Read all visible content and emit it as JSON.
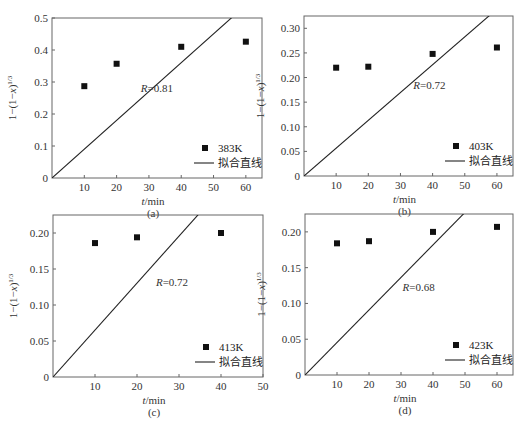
{
  "chart_data": [
    {
      "type": "scatter",
      "panel": "(a)",
      "title": "",
      "xlabel": "t/min",
      "ylabel": "1−(1−x)^1/3",
      "xlim": [
        0,
        65
      ],
      "ylim": [
        0,
        0.5
      ],
      "xticks": [
        10,
        20,
        30,
        40,
        50,
        60
      ],
      "yticks": [
        0,
        0.1,
        0.2,
        0.3,
        0.4,
        0.5
      ],
      "ytick_labels": [
        "0",
        "0.1",
        "0.2",
        "0.3",
        "0.4",
        "0.5"
      ],
      "series": [
        {
          "name": "383K",
          "kind": "scatter",
          "x": [
            10,
            20,
            40,
            60
          ],
          "y": [
            0.287,
            0.357,
            0.41,
            0.426
          ]
        },
        {
          "name": "拟合直线",
          "kind": "line",
          "x": [
            0,
            55.5
          ],
          "y": [
            0,
            0.5
          ]
        }
      ],
      "annotation": {
        "text_prefix": "R",
        "text_value": "=0.81",
        "x": 27.5,
        "y": 0.27
      },
      "legend": {
        "position": "lower right",
        "entries": [
          "383K",
          "拟合直线"
        ]
      },
      "grid": false,
      "caption": "(a)"
    },
    {
      "type": "scatter",
      "panel": "(b)",
      "title": "",
      "xlabel": "t/min",
      "ylabel": "1−(1−x)^1/3",
      "xlim": [
        0,
        65
      ],
      "ylim": [
        0,
        0.325
      ],
      "xticks": [
        10,
        20,
        30,
        40,
        50,
        60
      ],
      "yticks": [
        0,
        0.05,
        0.1,
        0.15,
        0.2,
        0.25,
        0.3
      ],
      "ytick_labels": [
        "0",
        "0.05",
        "0.10",
        "0.15",
        "0.20",
        "0.25",
        "0.30"
      ],
      "series": [
        {
          "name": "403K",
          "kind": "scatter",
          "x": [
            10,
            20,
            40,
            60
          ],
          "y": [
            0.22,
            0.222,
            0.248,
            0.261
          ]
        },
        {
          "name": "拟合直线",
          "kind": "line",
          "x": [
            0,
            57.5
          ],
          "y": [
            0,
            0.325
          ]
        }
      ],
      "annotation": {
        "text_prefix": "R",
        "text_value": "=0.72",
        "x": 34,
        "y": 0.176
      },
      "legend": {
        "position": "lower right",
        "entries": [
          "403K",
          "拟合直线"
        ]
      },
      "grid": false,
      "caption": "(b)"
    },
    {
      "type": "scatter",
      "panel": "(c)",
      "title": "",
      "xlabel": "t/min",
      "ylabel": "1−(1−x)^1/3",
      "xlim": [
        0,
        50
      ],
      "ylim": [
        0,
        0.225
      ],
      "xticks": [
        10,
        20,
        30,
        40,
        50
      ],
      "yticks": [
        0,
        0.05,
        0.1,
        0.15,
        0.2
      ],
      "ytick_labels": [
        "0",
        "0.05",
        "0.10",
        "0.15",
        "0.20"
      ],
      "series": [
        {
          "name": "413K",
          "kind": "scatter",
          "x": [
            10,
            20,
            40
          ],
          "y": [
            0.186,
            0.194,
            0.2
          ]
        },
        {
          "name": "拟合直线",
          "kind": "line",
          "x": [
            0,
            34.5
          ],
          "y": [
            0,
            0.225
          ]
        }
      ],
      "annotation": {
        "text_prefix": "R",
        "text_value": "=0.72",
        "x": 24.5,
        "y": 0.127
      },
      "legend": {
        "position": "lower right",
        "entries": [
          "413K",
          "拟合直线"
        ]
      },
      "grid": false,
      "caption": "(c)"
    },
    {
      "type": "scatter",
      "panel": "(d)",
      "title": "",
      "xlabel": "t/min",
      "ylabel": "1−(1−x)^1/3",
      "xlim": [
        0,
        65
      ],
      "ylim": [
        0,
        0.225
      ],
      "xticks": [
        10,
        20,
        30,
        40,
        50,
        60
      ],
      "yticks": [
        0,
        0.05,
        0.1,
        0.15,
        0.2
      ],
      "ytick_labels": [
        "0",
        "0.05",
        "0.10",
        "0.15",
        "0.20"
      ],
      "series": [
        {
          "name": "423K",
          "kind": "scatter",
          "x": [
            10,
            20,
            40,
            60
          ],
          "y": [
            0.184,
            0.187,
            0.2,
            0.207
          ]
        },
        {
          "name": "拟合直线",
          "kind": "line",
          "x": [
            0,
            49.5
          ],
          "y": [
            0,
            0.225
          ]
        }
      ],
      "annotation": {
        "text_prefix": "R",
        "text_value": "=0.68",
        "x": 30.5,
        "y": 0.117
      },
      "legend": {
        "position": "lower right",
        "entries": [
          "423K",
          "拟合直线"
        ]
      },
      "grid": false,
      "caption": "(d)"
    }
  ],
  "layout": {
    "panels": [
      {
        "left": 52,
        "top": 18,
        "right": 262,
        "bottom": 178
      },
      {
        "left": 304,
        "top": 16,
        "right": 513,
        "bottom": 176
      },
      {
        "left": 53,
        "top": 215,
        "right": 263,
        "bottom": 377
      },
      {
        "left": 305,
        "top": 214,
        "right": 513,
        "bottom": 375
      }
    ]
  }
}
